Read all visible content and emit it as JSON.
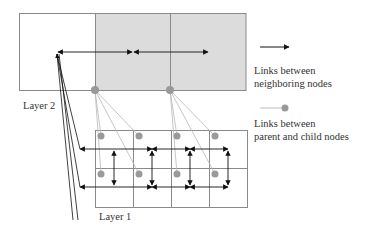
{
  "diagram": {
    "layer2_label": "Layer 2",
    "layer1_label": "Layer 1",
    "legend": [
      {
        "icon": "arrow-icon",
        "line1": "Links between",
        "line2": "neighboring nodes"
      },
      {
        "icon": "dot-line-icon",
        "line1": "Links between",
        "line2": "parent and child nodes"
      }
    ],
    "colors": {
      "shaded_cell": "#d9d9d9",
      "box_border": "#8a8a8a",
      "node_dot": "#999999",
      "arrow": "#111111",
      "parent_link": "#b5b5b5"
    },
    "layer2": {
      "columns": 3,
      "rows": 1,
      "shaded_columns": [
        2,
        3
      ]
    },
    "layer1": {
      "columns": 4,
      "rows": 2
    }
  }
}
